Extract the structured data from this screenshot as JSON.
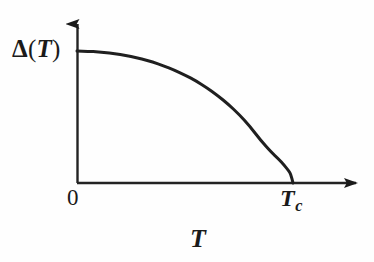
{
  "figure": {
    "kind": "line-plot",
    "background_color": "#fefefe",
    "ink_color": "#1a1a1a",
    "width": 374,
    "height": 262
  },
  "labels": {
    "y_axis": {
      "full_text": "Δ(T)",
      "delta": "Δ",
      "open_paren": "(",
      "variable": "T",
      "close_paren": ")"
    },
    "origin": "0",
    "critical_temperature": {
      "full_text": "Tc",
      "symbol": "T",
      "subscript": "c"
    },
    "x_axis": "T"
  },
  "axes": {
    "x": {
      "label": "T",
      "origin_label": "0",
      "end_label": "Tc",
      "has_arrow": true,
      "origin_px": 77,
      "end_px": 368,
      "baseline_px": 183
    },
    "y": {
      "label": "Δ(T)",
      "has_arrow": true,
      "top_px": 12,
      "baseline_px": 183,
      "axis_px": 77
    }
  },
  "chart_data": {
    "type": "line",
    "title": "",
    "subtitle": "",
    "xlabel": "T",
    "ylabel": "Δ(T)",
    "legend": [],
    "legend_position": "none",
    "grid": false,
    "xlim": [
      0,
      1.25
    ],
    "ylim": [
      0,
      1.15
    ],
    "xticks": [
      0,
      1
    ],
    "xticklabels": [
      "0",
      "Tc"
    ],
    "yticks": [
      1
    ],
    "yticklabels": [
      "Δ(T)"
    ],
    "annotations": [],
    "series": [
      {
        "name": "BCS energy gap",
        "description": "Superconducting energy gap vanishing with square-root behaviour at Tc",
        "color": "#1f1f1f",
        "linewidth": 3,
        "x": [
          0.0,
          0.05,
          0.1,
          0.15,
          0.2,
          0.25,
          0.3,
          0.35,
          0.4,
          0.45,
          0.5,
          0.55,
          0.6,
          0.65,
          0.7,
          0.75,
          0.8,
          0.85,
          0.9,
          0.93,
          0.96,
          0.98,
          0.99,
          1.0
        ],
        "y": [
          1.0,
          0.998,
          0.993,
          0.985,
          0.974,
          0.959,
          0.94,
          0.917,
          0.889,
          0.856,
          0.818,
          0.774,
          0.723,
          0.664,
          0.597,
          0.52,
          0.43,
          0.324,
          0.232,
          0.188,
          0.133,
          0.093,
          0.066,
          0.0
        ]
      }
    ],
    "svg_path_px": "M 77,51 C 110,53 145,70 175,88 C 215,112 250,133 272,152 C 284,162 290,172 293,183"
  }
}
